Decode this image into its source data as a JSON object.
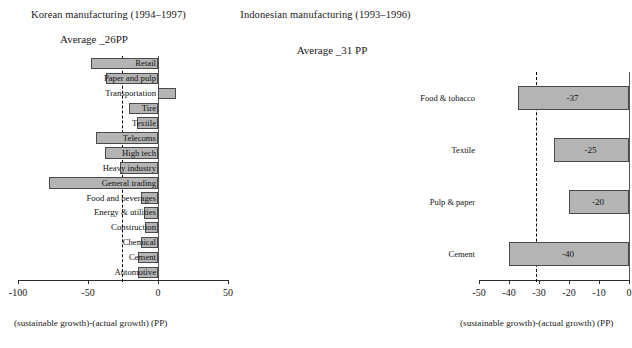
{
  "left": {
    "title": "Korean manufacturing (1994–1997)",
    "average_label": "Average  _26PP",
    "axis_caption": "(sustainable growth)-(actual growth) (PP)",
    "ticks": [
      "-100",
      "-50",
      "0",
      "50"
    ]
  },
  "right": {
    "title": "Indonesian manufacturing (1993–1996)",
    "average_label": "Average  _31 PP",
    "axis_caption": "(sustainable growth)-(actual growth) (PP)",
    "ticks": [
      "-50",
      "-40",
      "-30",
      "-20",
      "-10",
      "0"
    ]
  },
  "chart_data": [
    {
      "type": "bar",
      "orientation": "horizontal",
      "title": "Korean manufacturing (1994–1997)",
      "subtitle": "Average  _26PP",
      "xlabel": "(sustainable growth)-(actual growth) (PP)",
      "ylabel": "",
      "xlim": [
        -100,
        50
      ],
      "xticks": [
        -100,
        -50,
        0,
        50
      ],
      "grid": false,
      "legend": false,
      "reference_line": {
        "label": "Average",
        "value": -26,
        "style": "dashed"
      },
      "categories": [
        "Retail",
        "Paper and pulp",
        "Transportation",
        "Tire",
        "Textile",
        "Telecoms",
        "High tech",
        "Heavy industry",
        "General trading",
        "Food and beverages",
        "Energy & utilities",
        "Construction",
        "Chemical",
        "Cement",
        "Automotive"
      ],
      "values": [
        -48,
        -37,
        13,
        -21,
        -15,
        -44,
        -38,
        -27,
        -78,
        -12,
        -10,
        -9,
        -12,
        -14,
        -14
      ]
    },
    {
      "type": "bar",
      "orientation": "horizontal",
      "title": "Indonesian manufacturing (1993–1996)",
      "subtitle": "Average  _31 PP",
      "xlabel": "(sustainable growth)-(actual growth) (PP)",
      "ylabel": "",
      "xlim": [
        -50,
        0
      ],
      "xticks": [
        -50,
        -40,
        -30,
        -20,
        -10,
        0
      ],
      "grid": false,
      "legend": false,
      "reference_line": {
        "label": "Average",
        "value": -31,
        "style": "dashed"
      },
      "categories": [
        "Food & tobacco",
        "Textile",
        "Pulp & paper",
        "Cement"
      ],
      "values": [
        -37,
        -25,
        -20,
        -40
      ],
      "data_labels": [
        "-37",
        "-25",
        "-20",
        "-40"
      ]
    }
  ]
}
